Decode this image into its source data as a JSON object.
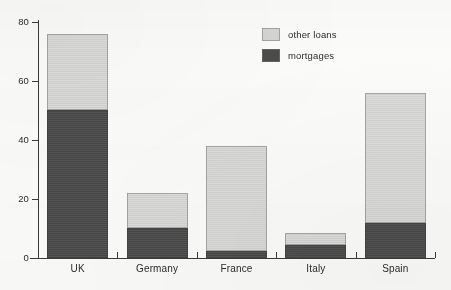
{
  "chart_data": {
    "type": "bar",
    "subtype": "stacked-bar",
    "title": "",
    "subtitle": "",
    "xlabel": "",
    "ylabel": "",
    "categories": [
      "UK",
      "Germany",
      "France",
      "Italy",
      "Spain"
    ],
    "series": [
      {
        "name": "mortgages",
        "color": "#4b4b4b",
        "values": [
          50,
          10,
          2.5,
          4.5,
          12
        ]
      },
      {
        "name": "other loans",
        "color": "#d4d4d2",
        "values": [
          26,
          12,
          35.5,
          4,
          44
        ]
      }
    ],
    "stack_order": [
      "mortgages",
      "other loans"
    ],
    "totals": [
      76,
      22,
      38,
      8.5,
      56
    ],
    "ylim": [
      0,
      80
    ],
    "yticks": [
      0,
      20,
      40,
      60,
      80
    ],
    "ytick_labels": [
      "0",
      "20",
      "40",
      "60",
      "80"
    ],
    "grid": false,
    "legend_position": "top-right",
    "legend_order": [
      "other loans",
      "mortgages"
    ]
  },
  "axes": {
    "y": {
      "ticks": [
        {
          "value": 80,
          "label": "80"
        },
        {
          "value": 60,
          "label": "60"
        },
        {
          "value": 40,
          "label": "40"
        },
        {
          "value": 20,
          "label": "20"
        },
        {
          "value": 0,
          "label": "0"
        }
      ]
    },
    "x": {
      "labels": [
        "UK",
        "Germany",
        "France",
        "Italy",
        "Spain"
      ]
    }
  },
  "legend": {
    "items": [
      {
        "label": "other loans",
        "color": "#d4d4d2"
      },
      {
        "label": "mortgages",
        "color": "#4b4b4b"
      }
    ]
  },
  "colors": {
    "other_loans": "#d4d4d2",
    "mortgages": "#4b4b4b",
    "axis": "#3a3a3a",
    "text": "#2b2b2b",
    "background": "#fbfbfa"
  }
}
